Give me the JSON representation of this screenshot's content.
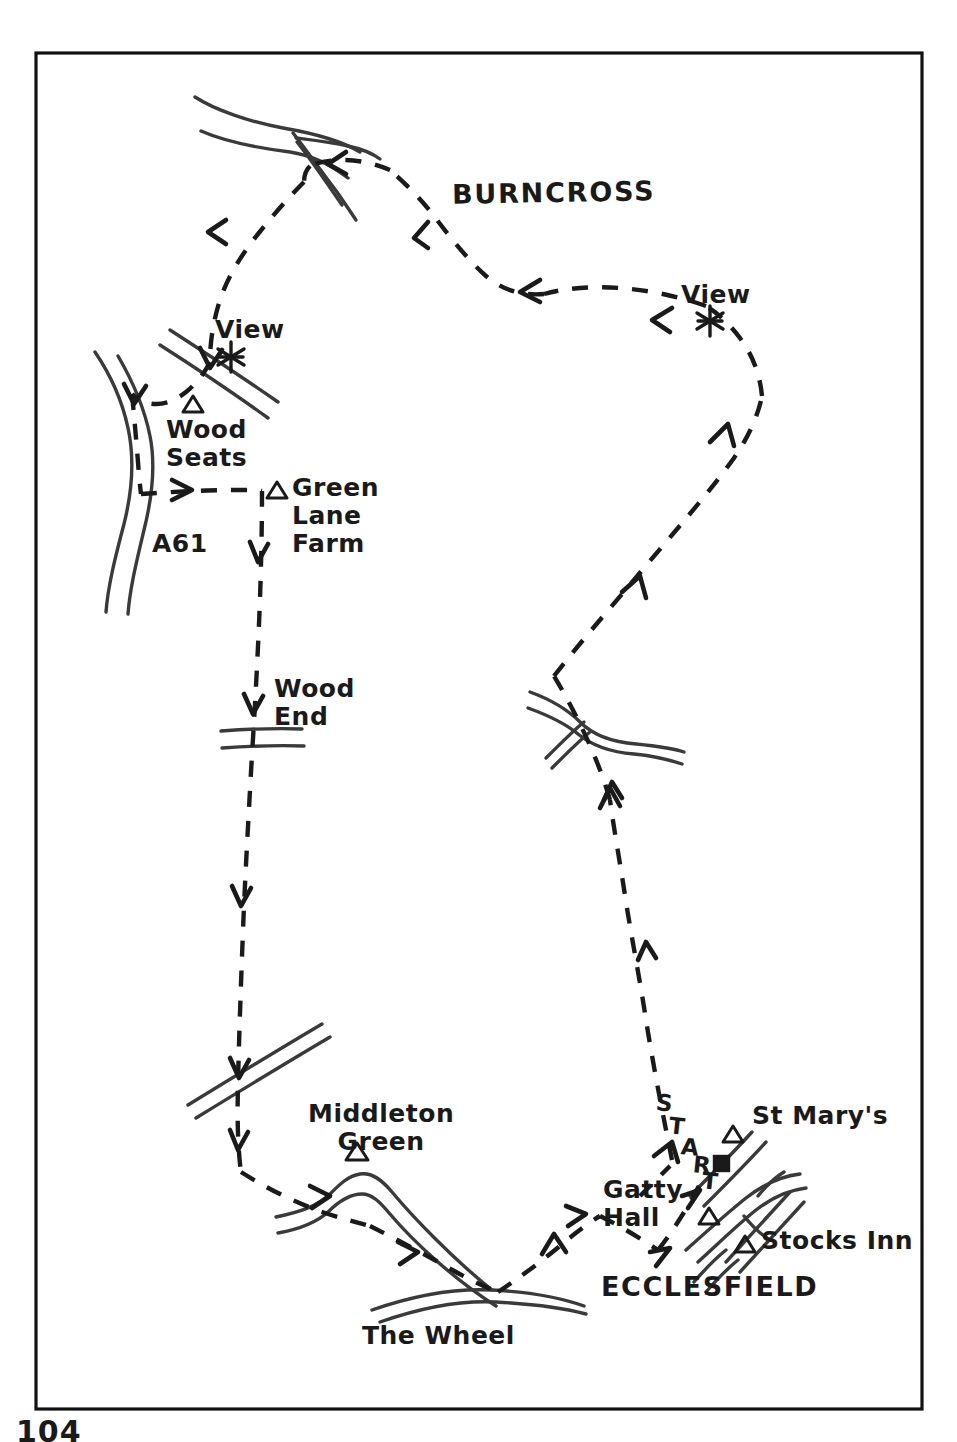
{
  "page": {
    "page_number": "104",
    "frame_color": "#111111",
    "background_color": "#ffffff",
    "ink_color": "#1a1a1a"
  },
  "map": {
    "title_area": "Ecclesfield circular walk sketch map",
    "town_label": "ECCLESFIELD",
    "area_label": "BURNCROSS",
    "start_letters": [
      "S",
      "T",
      "A",
      "R",
      "T"
    ],
    "start_word": "START",
    "labels": [
      {
        "id": "burncross",
        "text": "BURNCROSS",
        "x": 452,
        "y": 178,
        "kind": "area"
      },
      {
        "id": "view-left",
        "text": "View",
        "x": 215,
        "y": 316,
        "kind": "feature"
      },
      {
        "id": "view-right",
        "text": "View",
        "x": 681,
        "y": 281,
        "kind": "feature"
      },
      {
        "id": "wood-seats",
        "text": "Wood\nSeats",
        "x": 166,
        "y": 416,
        "kind": "place"
      },
      {
        "id": "green-lane-farm",
        "text": "Green\nLane\nFarm",
        "x": 292,
        "y": 474,
        "kind": "place"
      },
      {
        "id": "a61",
        "text": "A61",
        "x": 152,
        "y": 530,
        "kind": "road"
      },
      {
        "id": "wood-end",
        "text": "Wood\nEnd",
        "x": 274,
        "y": 675,
        "kind": "place"
      },
      {
        "id": "middleton-green",
        "text": "Middleton\nGreen",
        "x": 308,
        "y": 1100,
        "kind": "place"
      },
      {
        "id": "the-wheel",
        "text": "The Wheel",
        "x": 362,
        "y": 1322,
        "kind": "place"
      },
      {
        "id": "gatty-hall",
        "text": "Gatty\nHall",
        "x": 603,
        "y": 1176,
        "kind": "place"
      },
      {
        "id": "st-marys",
        "text": "St Mary's",
        "x": 752,
        "y": 1102,
        "kind": "place"
      },
      {
        "id": "stocks-inn",
        "text": "Stocks Inn",
        "x": 761,
        "y": 1227,
        "kind": "place"
      },
      {
        "id": "ecclesfield",
        "text": "ECCLESFIELD",
        "x": 601,
        "y": 1272,
        "kind": "town"
      }
    ],
    "markers": {
      "viewpoint_star_count": 2,
      "triangle_landmarks": [
        "Wood Seats",
        "Green Lane Farm",
        "Middleton Green",
        "St Mary's",
        "Gatty Hall",
        "Stocks Inn"
      ],
      "square_marker": "church-or-building",
      "viewpoints": [
        {
          "id": "view-star-left",
          "x": 231,
          "y": 356
        },
        {
          "id": "view-star-right",
          "x": 710,
          "y": 320
        }
      ],
      "triangles": [
        {
          "id": "tri-wood-seats",
          "x": 193,
          "y": 404
        },
        {
          "id": "tri-green-lane-farm",
          "x": 277,
          "y": 490
        },
        {
          "id": "tri-middleton-green",
          "x": 357,
          "y": 1152
        },
        {
          "id": "tri-st-marys",
          "x": 733,
          "y": 1134
        },
        {
          "id": "tri-gatty-hall",
          "x": 709,
          "y": 1216
        },
        {
          "id": "tri-stocks-inn",
          "x": 745,
          "y": 1244
        }
      ],
      "squares": [
        {
          "id": "sq-church",
          "x": 721,
          "y": 1163
        }
      ]
    },
    "route": {
      "style": "dashed",
      "direction_arrows": 16,
      "description": "Circular walking route starting at Ecclesfield"
    }
  }
}
